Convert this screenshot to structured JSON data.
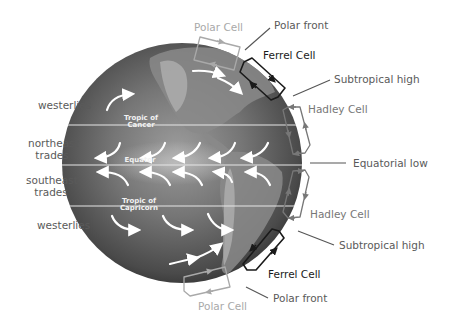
{
  "diagram": {
    "left_labels": {
      "westerlies_north": "westerlies",
      "northeast_trades_1": "northeast",
      "northeast_trades_2": "trades",
      "southeast_trades_1": "southeast",
      "southeast_trades_2": "trades",
      "westerlies_south": "westerlies"
    },
    "globe_labels": {
      "tropic_cancer_1": "Tropic of",
      "tropic_cancer_2": "Cancer",
      "equator": "Equator",
      "tropic_capricorn_1": "Tropic of",
      "tropic_capricorn_2": "Capricorn"
    },
    "right_labels": {
      "polar_cell_north": "Polar Cell",
      "polar_front_north": "Polar front",
      "ferrel_cell_north": "Ferrel Cell",
      "subtropical_high_north": "Subtropical high",
      "hadley_cell_north": "Hadley Cell",
      "equatorial_low": "Equatorial low",
      "hadley_cell_south": "Hadley Cell",
      "subtropical_high_south": "Subtropical high",
      "ferrel_cell_south": "Ferrel Cell",
      "polar_front_south": "Polar front",
      "polar_cell_south": "Polar Cell"
    },
    "colors": {
      "background": "#ffffff",
      "globe_dark": "#3f3f3f",
      "globe_light": "#9a9a9a",
      "latitude_line": "#e6e6e6",
      "ferrel_cell": "#1a1a1a",
      "hadley_cell": "#777777",
      "polar_cell": "#a9a9a9",
      "leader_line": "#555555"
    }
  }
}
